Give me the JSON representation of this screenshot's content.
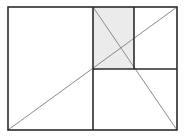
{
  "diagram": {
    "type": "golden-rectangle-subdivision",
    "colors": {
      "background": "#ffffff",
      "outline": "#2b2b2b",
      "diagonal": "#8a8a8a",
      "shade": "#ebebeb"
    },
    "outer_rect": {
      "x": 8,
      "y": 7,
      "w": 169,
      "h": 123
    },
    "shaded_rect": {
      "x": 93,
      "y": 7,
      "w": 41,
      "h": 62
    },
    "lines": {
      "main_vertical": {
        "x1": 93,
        "y1": 7,
        "x2": 93,
        "y2": 130
      },
      "right_horizontal": {
        "x1": 93,
        "y1": 69,
        "x2": 177,
        "y2": 69
      },
      "small_vertical": {
        "x1": 134,
        "y1": 7,
        "x2": 134,
        "y2": 69
      },
      "diagonal_main": {
        "x1": 8,
        "y1": 130,
        "x2": 177,
        "y2": 7
      },
      "diagonal_secondary": {
        "x1": 93,
        "y1": 7,
        "x2": 177,
        "y2": 130
      }
    }
  }
}
